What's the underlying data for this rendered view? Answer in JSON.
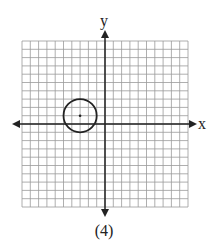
{
  "chart_data": {
    "type": "scatter",
    "title": "",
    "caption": "(4)",
    "xlabel": "x",
    "ylabel": "y",
    "xlim": [
      -10,
      10
    ],
    "ylim": [
      -10,
      10
    ],
    "grid": true,
    "grid_step": 1,
    "shapes": [
      {
        "kind": "circle",
        "center": [
          -3,
          1
        ],
        "radius": 2,
        "center_marked": true
      }
    ]
  },
  "labels": {
    "x_axis": "x",
    "y_axis": "y",
    "caption": "(4)"
  },
  "colors": {
    "grid": "#9a9a9a",
    "axis": "#222222",
    "circle": "#222222"
  }
}
